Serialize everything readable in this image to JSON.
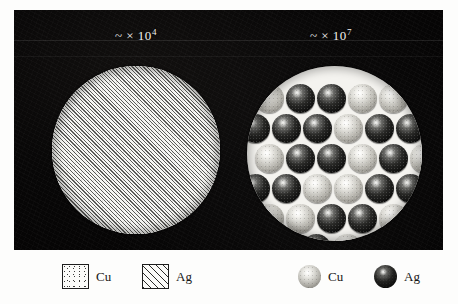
{
  "figure": {
    "background_color": "#ffffff",
    "panel_color": "#060505"
  },
  "panels": [
    {
      "id": "micro-left",
      "magnification_label": "~ × 10",
      "magnification_exponent": "4",
      "fill": "diagonal-hatch",
      "description": "Uniform diagonally hatched disc representing the mixed Cu-Ag phase"
    },
    {
      "id": "micro-right",
      "magnification_label": "~ × 10",
      "magnification_exponent": "7",
      "fill": "close-packed-spheres",
      "description": "Close-packed atomic spheres of Cu (light) and Ag (dark)"
    }
  ],
  "legend": {
    "items": [
      {
        "swatch": "stipple-square",
        "label": "Cu",
        "element": "Cu",
        "color": "#fbfbf9"
      },
      {
        "swatch": "hatch-square",
        "label": "Ag",
        "element": "Ag",
        "color": "#2b2b29"
      },
      {
        "swatch": "light-sphere",
        "label": "Cu",
        "element": "Cu",
        "color": "#d4d3cd"
      },
      {
        "swatch": "dark-sphere",
        "label": "Ag",
        "element": "Ag",
        "color": "#0e0e0d"
      }
    ]
  },
  "chart_data": {
    "type": "scatter",
    "xlabel": "",
    "ylabel": "",
    "legend_position": "bottom",
    "grid": false,
    "series": [
      {
        "name": "Cu",
        "marker": "light-sphere",
        "color": "#d4d3cd"
      },
      {
        "name": "Ag",
        "marker": "dark-sphere",
        "color": "#0e0e0d"
      }
    ],
    "atom_rows": [
      {
        "row": 1,
        "y": 18,
        "x_start": 8,
        "spacing": 31,
        "species": [
          "Cu",
          "Ag",
          "Ag",
          "Cu",
          "Cu"
        ]
      },
      {
        "row": 2,
        "y": 48,
        "x_start": -6,
        "spacing": 31,
        "species": [
          "Ag",
          "Ag",
          "Ag",
          "Cu",
          "Ag",
          "Ag"
        ]
      },
      {
        "row": 3,
        "y": 78,
        "x_start": 8,
        "spacing": 31,
        "species": [
          "Cu",
          "Ag",
          "Ag",
          "Cu",
          "Ag",
          "Cu"
        ]
      },
      {
        "row": 4,
        "y": 108,
        "x_start": -6,
        "spacing": 31,
        "species": [
          "Ag",
          "Ag",
          "Cu",
          "Cu",
          "Ag",
          "Ag",
          "Cu"
        ]
      },
      {
        "row": 5,
        "y": 138,
        "x_start": 8,
        "spacing": 31,
        "species": [
          "Cu",
          "Cu",
          "Ag",
          "Ag",
          "Cu",
          "Cu"
        ]
      },
      {
        "row": 6,
        "y": 168,
        "x_start": 24,
        "spacing": 31,
        "species": [
          "Ag",
          "Ag",
          "Cu",
          "Cu"
        ]
      }
    ],
    "atom_diameter": 29,
    "counts": {
      "Cu": 15,
      "Ag": 19
    }
  }
}
